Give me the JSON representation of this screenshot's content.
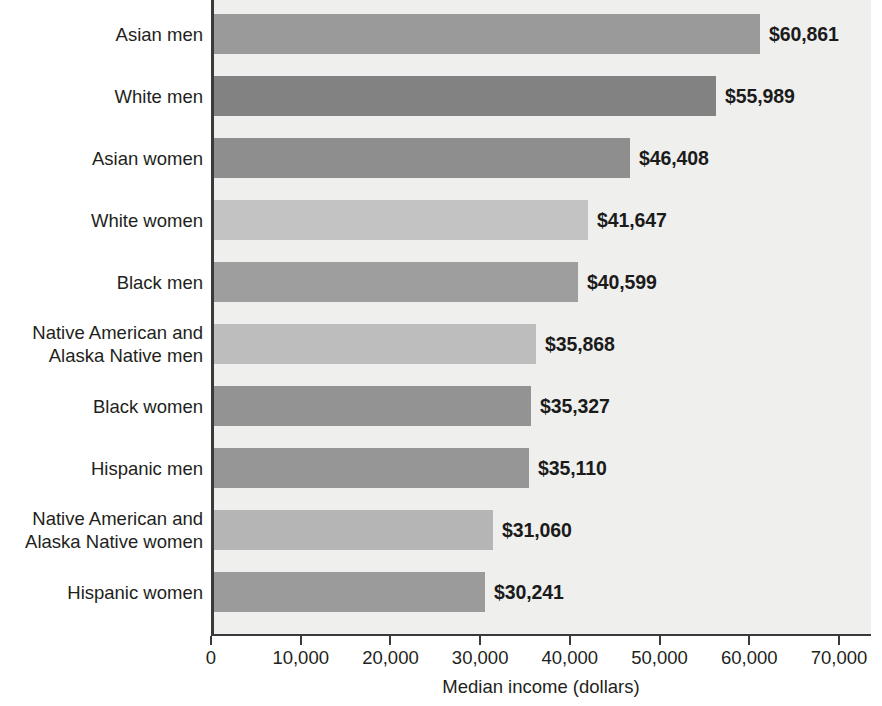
{
  "chart_data": {
    "type": "bar",
    "orientation": "horizontal",
    "title": "",
    "xlabel": "Median income (dollars)",
    "ylabel": "",
    "xlim": [
      0,
      70000
    ],
    "xticks": [
      0,
      10000,
      20000,
      30000,
      40000,
      50000,
      60000,
      70000
    ],
    "xtick_labels": [
      "0",
      "10,000",
      "20,000",
      "30,000",
      "40,000",
      "50,000",
      "60,000",
      "70,000"
    ],
    "grid": false,
    "legend": "none",
    "categories": [
      "Asian men",
      "White men",
      "Asian women",
      "White women",
      "Black men",
      "Native American and\nAlaska Native men",
      "Black women",
      "Hispanic men",
      "Native American and\nAlaska Native women",
      "Hispanic women"
    ],
    "values": [
      60861,
      55989,
      46408,
      41647,
      40599,
      35868,
      35327,
      35110,
      31060,
      30241
    ],
    "value_labels": [
      "$60,861",
      "$55,989",
      "$46,408",
      "$41,647",
      "$40,599",
      "$35,868",
      "$35,327",
      "$35,110",
      "$31,060",
      "$30,241"
    ],
    "bar_colors": [
      "#9a9a9a",
      "#828282",
      "#8e8e8e",
      "#c3c3c3",
      "#9e9e9e",
      "#bdbdbd",
      "#939393",
      "#969696",
      "#b5b5b5",
      "#9b9b9b"
    ]
  },
  "colors": {
    "plot_background": "#efefee",
    "page_background": "#ffffff",
    "axis": "#3a3a3a",
    "text": "#231f20"
  }
}
